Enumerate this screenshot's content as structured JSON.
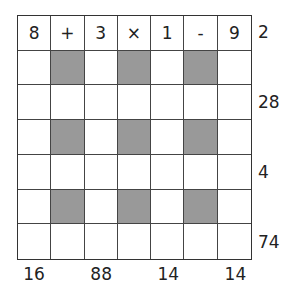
{
  "puzzle": {
    "rows": [
      [
        "8",
        "+",
        "3",
        "×",
        "1",
        "-",
        "9"
      ],
      [
        "",
        "",
        "",
        "",
        "",
        "",
        ""
      ],
      [
        "",
        "",
        "",
        "",
        "",
        "",
        ""
      ],
      [
        "",
        "",
        "",
        "",
        "",
        "",
        ""
      ],
      [
        "",
        "",
        "",
        "",
        "",
        "",
        ""
      ],
      [
        "",
        "",
        "",
        "",
        "",
        "",
        ""
      ],
      [
        "",
        "",
        "",
        "",
        "",
        "",
        ""
      ]
    ],
    "shaded_cells": [
      [
        1,
        1
      ],
      [
        1,
        3
      ],
      [
        1,
        5
      ],
      [
        3,
        1
      ],
      [
        3,
        3
      ],
      [
        3,
        5
      ],
      [
        5,
        1
      ],
      [
        5,
        3
      ],
      [
        5,
        5
      ]
    ],
    "row_results": [
      {
        "row": 0,
        "value": "2"
      },
      {
        "row": 2,
        "value": "28"
      },
      {
        "row": 4,
        "value": "4"
      },
      {
        "row": 6,
        "value": "74"
      }
    ],
    "column_results": [
      {
        "col": 0,
        "value": "16"
      },
      {
        "col": 2,
        "value": "88"
      },
      {
        "col": 4,
        "value": "14"
      },
      {
        "col": 6,
        "value": "14"
      }
    ],
    "colors": {
      "shade": "#999999",
      "line": "#444444"
    }
  }
}
